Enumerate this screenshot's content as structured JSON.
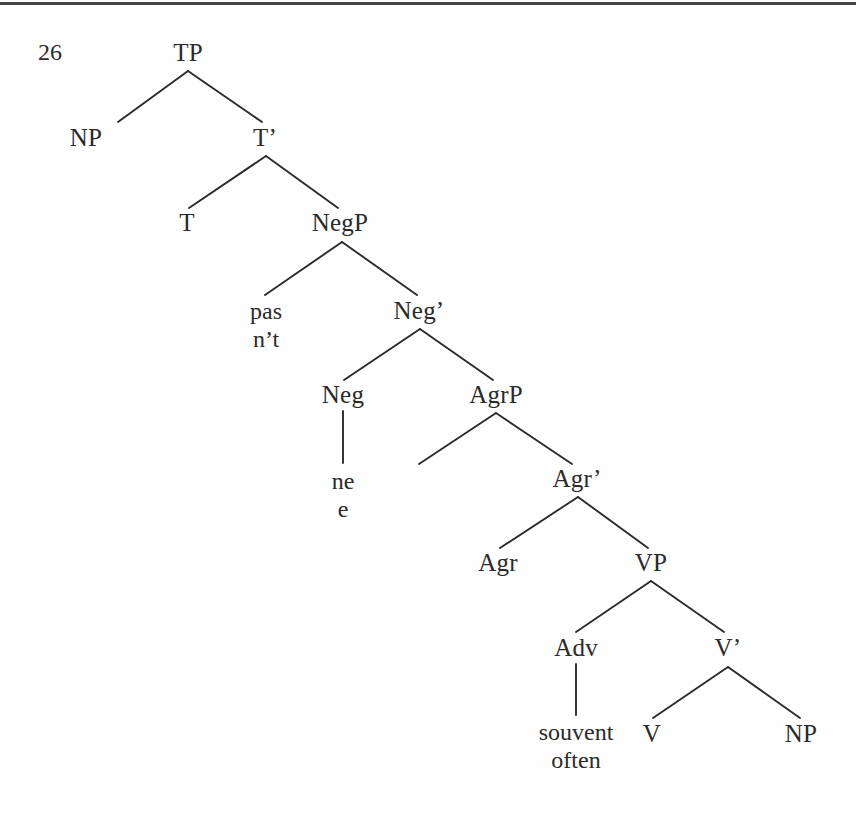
{
  "figure": {
    "example_number": "26",
    "caption": "",
    "background_color": "#fefefe",
    "ink_color": "#2b2b2b",
    "rule_color": "#343434"
  },
  "tree": {
    "nodes": [
      {
        "id": "TP",
        "label": "TP",
        "x": 188,
        "y": 52,
        "kind": "category"
      },
      {
        "id": "NP1",
        "label": "NP",
        "x": 86,
        "y": 137,
        "kind": "category"
      },
      {
        "id": "Tbar",
        "label": "T’",
        "x": 265,
        "y": 137,
        "kind": "category"
      },
      {
        "id": "T",
        "label": "T",
        "x": 187,
        "y": 222,
        "kind": "category"
      },
      {
        "id": "NegP",
        "label": "NegP",
        "x": 340,
        "y": 222,
        "kind": "category"
      },
      {
        "id": "Negbar",
        "label": "Neg’",
        "x": 419,
        "y": 310,
        "kind": "category"
      },
      {
        "id": "Neg",
        "label": "Neg",
        "x": 343,
        "y": 394,
        "kind": "category"
      },
      {
        "id": "AgrP",
        "label": "AgrP",
        "x": 496,
        "y": 394,
        "kind": "category"
      },
      {
        "id": "Agrbar",
        "label": "Agr’",
        "x": 577,
        "y": 478,
        "kind": "category"
      },
      {
        "id": "Agr",
        "label": "Agr",
        "x": 498,
        "y": 562,
        "kind": "category"
      },
      {
        "id": "VP",
        "label": "VP",
        "x": 651,
        "y": 562,
        "kind": "category"
      },
      {
        "id": "Adv",
        "label": "Adv",
        "x": 576,
        "y": 647,
        "kind": "category"
      },
      {
        "id": "Vbar",
        "label": "V’",
        "x": 728,
        "y": 647,
        "kind": "category"
      },
      {
        "id": "V",
        "label": "V",
        "x": 652,
        "y": 733,
        "kind": "category"
      },
      {
        "id": "NP2",
        "label": "NP",
        "x": 801,
        "y": 733,
        "kind": "category"
      }
    ],
    "terminals": [
      {
        "id": "neg-spec-terminal",
        "lines": [
          "pas",
          "n’t"
        ],
        "x": 266,
        "y": 326
      },
      {
        "id": "neg-head-terminal",
        "lines": [
          "ne",
          "e"
        ],
        "x": 343,
        "y": 496
      },
      {
        "id": "adv-terminal",
        "lines": [
          "souvent",
          "often"
        ],
        "x": 576,
        "y": 747
      }
    ],
    "edges": [
      {
        "from": "TP",
        "to": "NP1",
        "x1": 188,
        "y1": 71,
        "x2": 118,
        "y2": 122
      },
      {
        "from": "TP",
        "to": "Tbar",
        "x1": 188,
        "y1": 71,
        "x2": 262,
        "y2": 122
      },
      {
        "from": "Tbar",
        "to": "T",
        "x1": 266,
        "y1": 156,
        "x2": 189,
        "y2": 208
      },
      {
        "from": "Tbar",
        "to": "NegP",
        "x1": 266,
        "y1": 156,
        "x2": 338,
        "y2": 208
      },
      {
        "from": "NegP",
        "to": "pas",
        "x1": 342,
        "y1": 242,
        "x2": 265,
        "y2": 295
      },
      {
        "from": "NegP",
        "to": "Negbar",
        "x1": 342,
        "y1": 242,
        "x2": 417,
        "y2": 295
      },
      {
        "from": "Negbar",
        "to": "Neg",
        "x1": 420,
        "y1": 329,
        "x2": 344,
        "y2": 380
      },
      {
        "from": "Negbar",
        "to": "AgrP",
        "x1": 420,
        "y1": 329,
        "x2": 493,
        "y2": 380
      },
      {
        "from": "Neg",
        "to": "ne",
        "x1": 343,
        "y1": 411,
        "x2": 343,
        "y2": 463
      },
      {
        "from": "AgrP",
        "to": "spec",
        "x1": 496,
        "y1": 413,
        "x2": 419,
        "y2": 464
      },
      {
        "from": "AgrP",
        "to": "Agrbar",
        "x1": 496,
        "y1": 413,
        "x2": 572,
        "y2": 464
      },
      {
        "from": "Agrbar",
        "to": "Agr",
        "x1": 578,
        "y1": 497,
        "x2": 500,
        "y2": 548
      },
      {
        "from": "Agrbar",
        "to": "VP",
        "x1": 578,
        "y1": 497,
        "x2": 648,
        "y2": 548
      },
      {
        "from": "VP",
        "to": "Adv",
        "x1": 651,
        "y1": 581,
        "x2": 576,
        "y2": 632
      },
      {
        "from": "VP",
        "to": "Vbar",
        "x1": 651,
        "y1": 581,
        "x2": 724,
        "y2": 632
      },
      {
        "from": "Adv",
        "to": "souvent",
        "x1": 576,
        "y1": 664,
        "x2": 576,
        "y2": 715
      },
      {
        "from": "Vbar",
        "to": "V",
        "x1": 728,
        "y1": 667,
        "x2": 653,
        "y2": 718
      },
      {
        "from": "Vbar",
        "to": "NP2",
        "x1": 728,
        "y1": 667,
        "x2": 800,
        "y2": 718
      }
    ]
  }
}
